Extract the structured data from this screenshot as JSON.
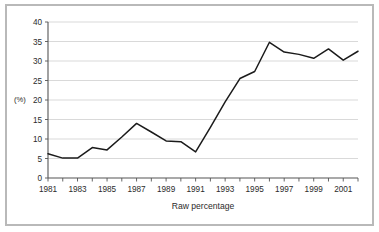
{
  "chart_data": {
    "type": "line",
    "title": "",
    "xlabel": "Raw percentage",
    "ylabel": "(%)",
    "ylim": [
      0,
      40
    ],
    "xlim": [
      1981,
      2002
    ],
    "grid": true,
    "legend": false,
    "y_ticks": [
      0,
      5,
      10,
      15,
      20,
      25,
      30,
      35,
      40
    ],
    "y_tick_labels": [
      "0",
      "5",
      "10",
      "15",
      "20",
      "25",
      "30",
      "35",
      "40"
    ],
    "x_ticks": [
      1981,
      1982,
      1983,
      1984,
      1985,
      1986,
      1987,
      1988,
      1989,
      1990,
      1991,
      1992,
      1993,
      1994,
      1995,
      1996,
      1997,
      1998,
      1999,
      2000,
      2001,
      2002
    ],
    "x_tick_labels_shown": [
      "1981",
      "1983",
      "1985",
      "1987",
      "1989",
      "1991",
      "1993",
      "1995",
      "1997",
      "1999",
      "2001"
    ],
    "x": [
      1981,
      1982,
      1983,
      1984,
      1985,
      1986,
      1987,
      1988,
      1989,
      1990,
      1991,
      1992,
      1993,
      1994,
      1995,
      1996,
      1997,
      1998,
      1999,
      2000,
      2001,
      2002
    ],
    "values": [
      6.2,
      5.1,
      5.1,
      7.8,
      7.2,
      10.5,
      14.0,
      11.8,
      9.5,
      9.3,
      6.7,
      13.0,
      19.5,
      25.5,
      27.3,
      34.8,
      32.3,
      31.7,
      30.7,
      33.1,
      30.2,
      32.5
    ],
    "series": [
      {
        "name": "Raw percentage",
        "color": "#1b1b1b",
        "values": [
          6.2,
          5.1,
          5.1,
          7.8,
          7.2,
          10.5,
          14.0,
          11.8,
          9.5,
          9.3,
          6.7,
          13.0,
          19.5,
          25.5,
          27.3,
          34.8,
          32.3,
          31.7,
          30.7,
          33.1,
          30.2,
          32.5
        ]
      }
    ]
  },
  "colors": {
    "frame_border": "#b9b9b9",
    "gridline": "#c8c8c8",
    "axis": "#555555",
    "line": "#1b1b1b",
    "background": "#ffffff",
    "text": "#2b2b2b"
  }
}
